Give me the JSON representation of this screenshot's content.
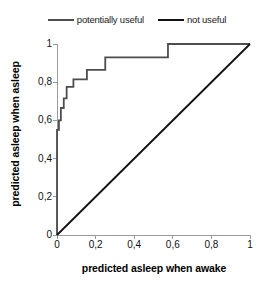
{
  "chart_data": {
    "type": "line",
    "title": "",
    "subtitle": "",
    "xlabel": "predicted asleep when awake",
    "ylabel": "predicted asleep when asleep",
    "xlim": [
      0,
      1
    ],
    "ylim": [
      0,
      1
    ],
    "grid": false,
    "legend_position": "top-center",
    "xticks": [
      "0",
      "0,2",
      "0,4",
      "0,6",
      "0,8",
      "1"
    ],
    "xtick_values": [
      0,
      0.2,
      0.4,
      0.6,
      0.8,
      1
    ],
    "yticks": [
      "0",
      "0,2",
      "0,4",
      "0,6",
      "0,8",
      "1"
    ],
    "ytick_values": [
      0,
      0.2,
      0.4,
      0.6,
      0.8,
      1
    ],
    "annotations": [],
    "series": [
      {
        "name": "potentially useful",
        "style": "step",
        "color": "#4d4d4d",
        "linewidth": 1.8,
        "x": [
          0,
          0,
          0.01,
          0.01,
          0.02,
          0.02,
          0.035,
          0.035,
          0.05,
          0.05,
          0.085,
          0.085,
          0.155,
          0.155,
          0.25,
          0.25,
          0.575,
          0.575,
          1
        ],
        "y": [
          0,
          0.55,
          0.55,
          0.6,
          0.6,
          0.665,
          0.665,
          0.715,
          0.715,
          0.775,
          0.775,
          0.815,
          0.815,
          0.865,
          0.865,
          0.93,
          0.93,
          1,
          1
        ]
      },
      {
        "name": "not useful",
        "style": "line",
        "color": "#111111",
        "linewidth": 1.8,
        "x": [
          0,
          1
        ],
        "y": [
          0,
          1
        ]
      }
    ]
  },
  "legend": {
    "entries": [
      {
        "label": "potentially useful",
        "color": "#4d4d4d"
      },
      {
        "label": "not useful",
        "color": "#111111"
      }
    ]
  },
  "axes": {
    "x_title": "predicted asleep when awake",
    "y_title": "predicted asleep when asleep",
    "x_tick_labels": [
      "0",
      "0,2",
      "0,4",
      "0,6",
      "0,8",
      "1"
    ],
    "y_tick_labels": [
      "1",
      "0,8",
      "0,6",
      "0,4",
      "0,2",
      "0"
    ],
    "axis_color": "#9a9a9a"
  }
}
